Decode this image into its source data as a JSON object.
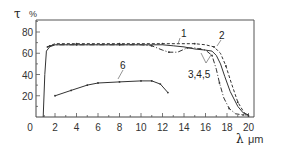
{
  "chart_data": {
    "type": "line",
    "title": "",
    "xlabel": "λ μm",
    "ylabel": "τ %",
    "xlim": [
      0,
      20.5
    ],
    "ylim": [
      0,
      91
    ],
    "grid": false,
    "legend": "inline curve labels",
    "x_ticks": [
      0,
      2,
      4,
      6,
      8,
      10,
      12,
      14,
      16,
      18,
      20
    ],
    "x_tick_labels": [
      "0",
      "2",
      "4",
      "6",
      "8",
      "10",
      "12",
      "14",
      "16",
      "18",
      "20"
    ],
    "y_ticks": [
      20,
      40,
      60,
      80
    ],
    "y_tick_labels": [
      "20",
      "40",
      "60",
      "80"
    ],
    "series": [
      {
        "name": "1",
        "style": "solid",
        "x": [
          0.9,
          1.05,
          1.2,
          1.5,
          2,
          4,
          6,
          8,
          10,
          12,
          13,
          14,
          15,
          16,
          16.6,
          17,
          17.4,
          17.8,
          18.3,
          19,
          19.5,
          20
        ],
        "y": [
          0,
          40,
          62,
          66,
          68,
          68,
          68,
          68,
          68,
          68,
          67,
          66,
          64,
          63,
          62,
          58,
          50,
          38,
          24,
          10,
          4,
          2
        ]
      },
      {
        "name": "2",
        "style": "dashed",
        "x": [
          1.3,
          2,
          4,
          6,
          8,
          10,
          12,
          14,
          15,
          16,
          16.8,
          17.4,
          17.9,
          18.4,
          19,
          19.6,
          20
        ],
        "y": [
          66,
          69,
          69,
          69,
          69,
          69,
          69,
          69,
          69,
          68,
          66,
          60,
          48,
          32,
          14,
          4,
          1
        ]
      },
      {
        "name": "3,4,5",
        "style": "dash-dot",
        "x": [
          1.5,
          2,
          4,
          6,
          8,
          10,
          11,
          12,
          12.6,
          13.4,
          14.3,
          15,
          15.5,
          16,
          16.6,
          17,
          17.3,
          17.7,
          18.2,
          18.8,
          19.5,
          20
        ],
        "y": [
          67,
          68,
          68,
          68,
          68,
          68,
          67,
          63,
          61,
          61,
          65,
          65,
          64,
          63,
          58,
          45,
          32,
          18,
          8,
          3,
          2,
          2
        ]
      },
      {
        "name": "6",
        "style": "solid-with-markers",
        "x": [
          2,
          3.5,
          5,
          6,
          8,
          10,
          11,
          11.8,
          12.5
        ],
        "y": [
          20,
          25,
          30,
          32,
          33,
          34,
          34,
          31,
          23
        ]
      }
    ],
    "annotations": [
      {
        "text": "1",
        "x": 13.4,
        "y": 75
      },
      {
        "text": "2",
        "x": 17.8,
        "y": 73
      },
      {
        "text": "3,4,5",
        "x": 15.5,
        "y": 50
      },
      {
        "text": "6",
        "x": 9.5,
        "y": 40
      }
    ]
  },
  "labels": {
    "y_axis_symbol": "τ",
    "y_axis_unit": "%",
    "x_axis_symbol": "λ",
    "x_axis_unit": "μm",
    "origin": "0",
    "curve_1": "1",
    "curve_2": "2",
    "curve_345": "3,4,5",
    "curve_6": "6"
  }
}
